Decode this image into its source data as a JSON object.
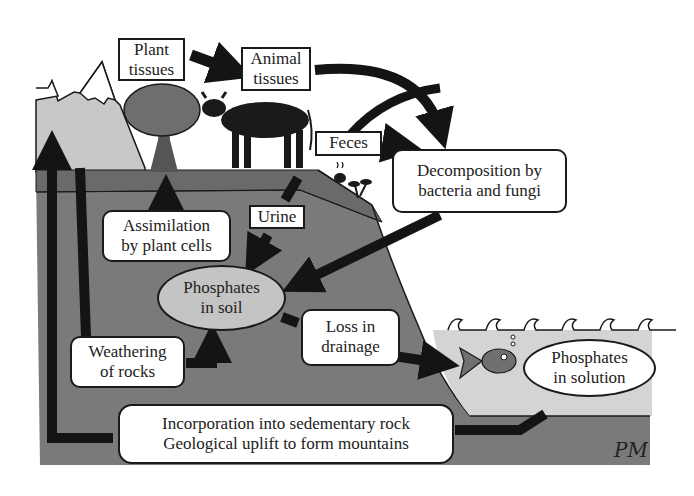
{
  "diagram": {
    "labels": {
      "plant_tissues": [
        "Plant",
        "tissues"
      ],
      "animal_tissues": [
        "Animal",
        "tissues"
      ],
      "feces": "Feces",
      "decomposition": [
        "Decomposition by",
        "bacteria and fungi"
      ],
      "urine": "Urine",
      "assimilation": [
        "Assimilation",
        "by plant cells"
      ],
      "phosphates_soil": [
        "Phosphates",
        "in soil"
      ],
      "loss_drainage": [
        "Loss in",
        "drainage"
      ],
      "weathering": [
        "Weathering",
        "of rocks"
      ],
      "phosphates_solution": [
        "Phosphates",
        "in solution"
      ],
      "sedimentary": [
        "Incorporation into sedementary rock",
        "Geological uplift to form mountains"
      ]
    },
    "signature": "PM",
    "colors": {
      "soil": "#7a7a7a",
      "topsoil": "#6a6a6a",
      "mountain": "#c8c8c8",
      "water": "#d4d4d4",
      "arrow": "#141414",
      "ellipse_fill": "#c4c4c4"
    }
  }
}
